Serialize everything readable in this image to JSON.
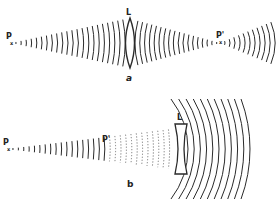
{
  "diagrams": [
    {
      "caption": "a",
      "source_label": "P",
      "image_label": "P'",
      "lens_label": "L",
      "lens_type": "convex",
      "source": {
        "x": 11,
        "y": 43
      },
      "lens": {
        "x": 130,
        "y": 43,
        "half_height": 25
      },
      "image": {
        "x": 220,
        "y": 43
      },
      "end_x": 276
    },
    {
      "caption": "b",
      "source_label": "P",
      "image_label": "P'",
      "lens_label": "L",
      "lens_type": "concave",
      "source": {
        "x": 7,
        "y": 149
      },
      "lens": {
        "x": 181,
        "y": 150,
        "half_height": 25
      },
      "image": {
        "x": 106,
        "y": 149
      },
      "end_x": 256
    }
  ],
  "colors": {
    "ink": "#2a2a2a",
    "faint": "#777777",
    "background": "#ffffff"
  }
}
